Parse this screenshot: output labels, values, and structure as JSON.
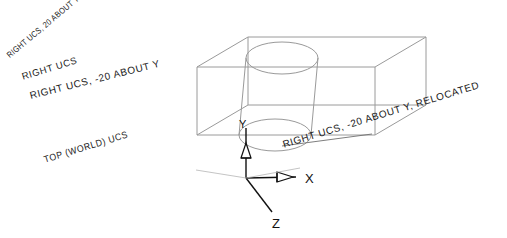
{
  "figure": {
    "background_color": "#ffffff",
    "line_color": "#9a9a9a",
    "axis_color": "#111111",
    "text_color": "#1a1a1a"
  },
  "labels": {
    "right_ucs_20_about_y": "RIGHT UCS, 20 ABOUT Y",
    "right_ucs": "RIGHT UCS",
    "right_ucs_minus20_about_y": "RIGHT UCS, -20 ABOUT Y",
    "top_world_ucs": "TOP (WORLD) UCS",
    "right_ucs_minus20_relocated": "RIGHT UCS, -20 ABOUT Y, RELOCATED"
  },
  "ucs_icon": {
    "x_axis_label": "X",
    "y_axis_label": "Y",
    "z_axis_label": "Z",
    "origin": {
      "x": 246,
      "y": 178
    }
  },
  "geometry": {
    "type": "isometric-wireframe",
    "solid": "rectangular-box-with-cylindrical-hole",
    "box_vertices": {
      "front_bottom_left": {
        "x": 197,
        "y": 135
      },
      "front_bottom_right": {
        "x": 375,
        "y": 135
      },
      "front_top_left": {
        "x": 197,
        "y": 67
      },
      "front_top_right": {
        "x": 375,
        "y": 67
      },
      "back_bottom_left": {
        "x": 248,
        "y": 105
      },
      "back_bottom_right": {
        "x": 426,
        "y": 105
      },
      "back_top_left": {
        "x": 248,
        "y": 37
      },
      "back_top_right": {
        "x": 426,
        "y": 37
      }
    },
    "cylinder": {
      "top_ellipse_center": {
        "x": 282,
        "y": 58
      },
      "bottom_ellipse_center": {
        "x": 275,
        "y": 135
      },
      "radius_x": 36,
      "radius_y": 16
    }
  }
}
